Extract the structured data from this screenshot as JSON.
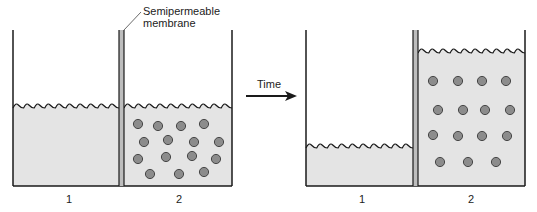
{
  "labels": {
    "membrane_line1": "Semipermeable",
    "membrane_line2": "membrane",
    "arrow": "Time",
    "before_left": "1",
    "before_right": "2",
    "after_left": "1",
    "after_right": "2"
  },
  "colors": {
    "stroke": "#1a1a1a",
    "water": "#e4e4e4",
    "solute_fill": "#8c8c8c",
    "solute_stroke": "#3a3a3a",
    "membrane_fill": "#bdbdbd"
  },
  "panels": [
    {
      "id": "before",
      "left_wall_x": 13,
      "membrane_x": 119,
      "membrane_w": 5,
      "right_wall_x": 232,
      "top_y": 30,
      "bottom_y": 186,
      "left_level_y": 108,
      "right_level_y": 108,
      "solutes": [
        [
          138,
          124
        ],
        [
          158,
          126
        ],
        [
          181,
          126
        ],
        [
          204,
          124
        ],
        [
          144,
          142
        ],
        [
          168,
          140
        ],
        [
          194,
          142
        ],
        [
          219,
          142
        ],
        [
          138,
          159
        ],
        [
          166,
          157
        ],
        [
          192,
          156
        ],
        [
          216,
          159
        ],
        [
          150,
          174
        ],
        [
          179,
          174
        ],
        [
          204,
          172
        ]
      ]
    },
    {
      "id": "after",
      "left_wall_x": 306,
      "membrane_x": 413,
      "membrane_w": 5,
      "right_wall_x": 525,
      "top_y": 30,
      "bottom_y": 186,
      "left_level_y": 148,
      "right_level_y": 53,
      "solutes": [
        [
          433,
          81
        ],
        [
          458,
          81
        ],
        [
          482,
          81
        ],
        [
          506,
          81
        ],
        [
          438,
          110
        ],
        [
          463,
          110
        ],
        [
          485,
          110
        ],
        [
          510,
          110
        ],
        [
          433,
          135
        ],
        [
          458,
          136
        ],
        [
          482,
          136
        ],
        [
          507,
          136
        ],
        [
          440,
          162
        ],
        [
          468,
          162
        ],
        [
          496,
          162
        ]
      ]
    }
  ]
}
